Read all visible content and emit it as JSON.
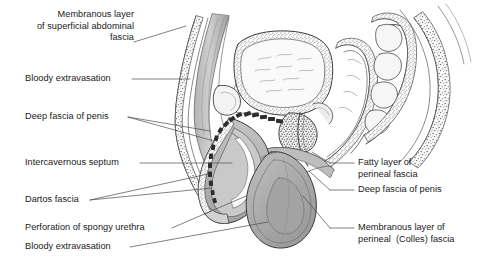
{
  "figure": {
    "background_color": "#ffffff",
    "text_color": "#1a1a1a",
    "leader_color": "#4a4a4a",
    "ink_color": "#404040",
    "fill_light": "#f2f2f2",
    "fill_mid": "#c9c9c9",
    "fill_gray": "#a8a8a8",
    "fill_dark": "#3a3a3a"
  },
  "labels_left": [
    {
      "name": "membranous-layer-superficial-abdominal-fascia",
      "lines": [
        "Membranous layer",
        "of superficial abdominal",
        "fascia"
      ]
    },
    {
      "name": "bloody-extravasation-upper",
      "lines": [
        "Bloody extravasation"
      ]
    },
    {
      "name": "deep-fascia-of-penis-left",
      "lines": [
        "Deep fascia of penis"
      ]
    },
    {
      "name": "intercavernous-septum",
      "lines": [
        "Intercavernous septum"
      ]
    },
    {
      "name": "dartos-fascia",
      "lines": [
        "Dartos fascia"
      ]
    },
    {
      "name": "perforation-of-spongy-urethra",
      "lines": [
        "Perforation of spongy urethra"
      ]
    },
    {
      "name": "bloody-extravasation-lower",
      "lines": [
        "Bloody extravasation"
      ]
    }
  ],
  "labels_right": [
    {
      "name": "fatty-layer-of-perineal-fascia",
      "lines": [
        "Fatty layer of",
        "perineal fascia"
      ]
    },
    {
      "name": "deep-fascia-of-penis-right",
      "lines": [
        "Deep fascia of penis"
      ]
    },
    {
      "name": "membranous-layer-of-perineal-colles-fascia",
      "lines": [
        "Membranous layer of",
        "perineal  (Colles) fascia"
      ]
    }
  ],
  "anatomy_parts": [
    "anterior-abdominal-wall",
    "superficial-abdominal-fascia-stipple",
    "rectus-muscle-band",
    "urinary-bladder",
    "bladder-wall-stipple",
    "pubic-bone",
    "prostate",
    "rectum",
    "sacrum-vertebrae",
    "gluteal-soft-tissue",
    "penis-shaft",
    "corpus-cavernosum",
    "spongy-urethra",
    "glans-penis",
    "scrotum",
    "testis",
    "extravasation-dashes",
    "perineal-membrane"
  ]
}
